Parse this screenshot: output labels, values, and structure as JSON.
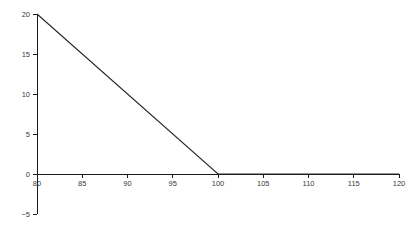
{
  "figure": {
    "background_color": "#ffffff",
    "width": 420,
    "height": 232
  },
  "chart_data": {
    "type": "line",
    "title": "",
    "subtitle": "",
    "xlabel": "",
    "ylabel": "",
    "xlim": [
      80,
      120
    ],
    "ylim": [
      -5,
      20
    ],
    "grid": false,
    "legend": null,
    "legend_position": "none",
    "annotations": [],
    "xticks": [
      80,
      85,
      90,
      95,
      100,
      105,
      110,
      115,
      120
    ],
    "xtick_labels": [
      "80",
      "85",
      "90",
      "95",
      "100",
      "105",
      "110",
      "115",
      "120"
    ],
    "yticks": [
      -5,
      0,
      5,
      10,
      15,
      20
    ],
    "ytick_labels": [
      "−5",
      "0",
      "5",
      "10",
      "15",
      "20"
    ],
    "series": [
      {
        "name": "payoff",
        "color": "#262626",
        "line_width": 1.1,
        "x": [
          80,
          100,
          120
        ],
        "values": [
          20,
          0,
          0
        ],
        "points": [
          {
            "x": 80,
            "y": 20
          },
          {
            "x": 100,
            "y": 0
          },
          {
            "x": 120,
            "y": 0
          }
        ]
      }
    ],
    "axes_style": {
      "x_axis_at_y": 0,
      "y_axis_at_x": 80,
      "x_tick_direction": "down",
      "y_tick_direction": "left",
      "tick_color": "#1a1a1a",
      "tick_label_color": "#3a3a3a",
      "spine_color": "#1a1a1a",
      "top_spine": false,
      "right_spine": false
    }
  }
}
